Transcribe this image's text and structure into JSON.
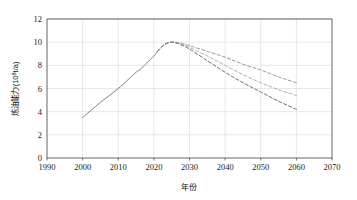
{
  "chart_data": {
    "type": "line",
    "title": "",
    "subtitle": "",
    "xlabel": "年份",
    "ylabel": "炼油能力/(10⁸t/a)",
    "ylabel_parts": {
      "text_main": "炼油能力/(10",
      "exponent": "8",
      "text_tail": "t/a)"
    },
    "xlim": [
      1990,
      2070
    ],
    "ylim": [
      0,
      12
    ],
    "x_ticks": [
      1990,
      2000,
      2010,
      2020,
      2030,
      2040,
      2050,
      2060,
      2070
    ],
    "y_ticks": [
      0,
      2,
      4,
      6,
      8,
      10,
      12
    ],
    "x_tick_labels": [
      "1990",
      "2000",
      "2010",
      "2020",
      "2030",
      "2040",
      "2050",
      "2060",
      "2070"
    ],
    "y_tick_labels": [
      "0",
      "2",
      "4",
      "6",
      "8",
      "10",
      "12"
    ],
    "grid": {
      "x_grid": true,
      "y_grid": true,
      "color": "#d9d9d9"
    },
    "legend": {
      "visible": false,
      "position": "none",
      "entries": []
    },
    "series": [
      {
        "name": "历史炼油能力",
        "style": "solid",
        "color": "#808080",
        "x": [
          2000,
          2005,
          2010,
          2015,
          2016,
          2018,
          2020,
          2021
        ],
        "values": [
          3.5,
          4.8,
          6.0,
          7.4,
          7.6,
          8.2,
          8.8,
          9.2
        ]
      },
      {
        "name": "情景一（高）",
        "style": "dashed",
        "color": "#9a9a9a",
        "x": [
          2021,
          2023,
          2025,
          2027,
          2030,
          2035,
          2040,
          2045,
          2050,
          2055,
          2060
        ],
        "values": [
          9.2,
          9.8,
          10.0,
          9.95,
          9.7,
          9.2,
          8.7,
          8.1,
          7.6,
          7.0,
          6.5
        ]
      },
      {
        "name": "情景二（中）",
        "style": "dashed",
        "color": "#b0b0b0",
        "x": [
          2021,
          2023,
          2025,
          2027,
          2030,
          2035,
          2040,
          2045,
          2050,
          2055,
          2060
        ],
        "values": [
          9.2,
          9.8,
          10.0,
          9.9,
          9.55,
          8.8,
          8.0,
          7.2,
          6.5,
          5.9,
          5.4
        ]
      },
      {
        "name": "情景三（低）",
        "style": "dashed",
        "color": "#6e6e6e",
        "x": [
          2021,
          2023,
          2025,
          2027,
          2030,
          2035,
          2040,
          2045,
          2050,
          2055,
          2060
        ],
        "values": [
          9.2,
          9.8,
          10.0,
          9.85,
          9.4,
          8.4,
          7.4,
          6.5,
          5.7,
          4.9,
          4.2
        ]
      }
    ],
    "annotations": []
  },
  "colors": {
    "plot_border": "#3f3f3f",
    "grid": "#d9d9d9",
    "background": "#ffffff",
    "text": "#111111"
  }
}
